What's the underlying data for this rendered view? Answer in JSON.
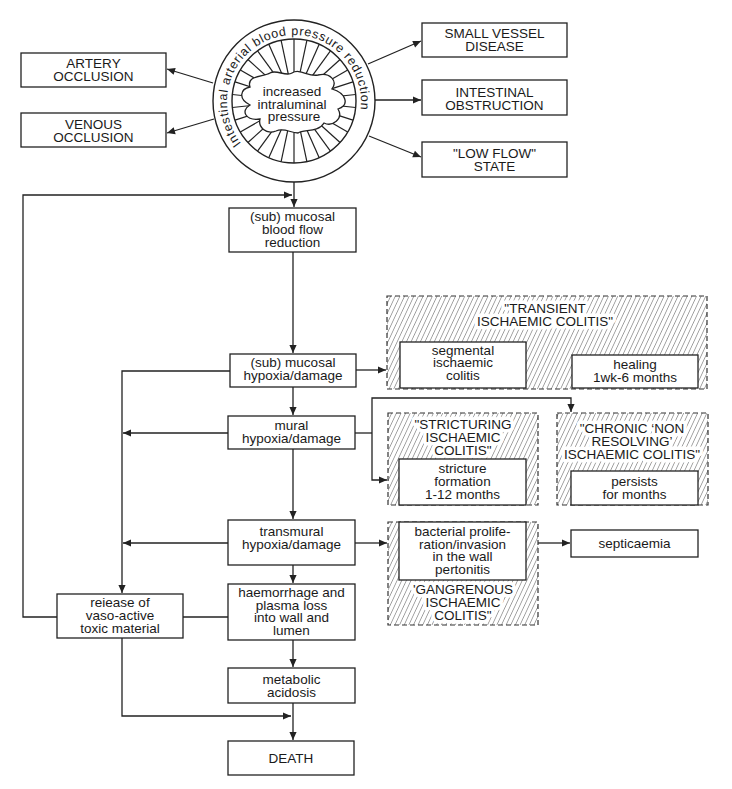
{
  "circle": {
    "ring_label": "Intestinal arterial blood pressure reduction",
    "center_lines": [
      "increased",
      "intraluminal",
      "pressure"
    ]
  },
  "causes": {
    "artery_occlusion": [
      "ARTERY",
      "OCCLUSION"
    ],
    "venous_occlusion": [
      "VENOUS",
      "OCCLUSION"
    ],
    "small_vessel_disease": [
      "SMALL VESSEL",
      "DISEASE"
    ],
    "intestinal_obstruction": [
      "INTESTINAL",
      "OBSTRUCTION"
    ],
    "low_flow_state": [
      "\"LOW FLOW\"",
      "STATE"
    ]
  },
  "cascade": {
    "blood_flow_reduction": [
      "(sub) mucosal",
      "blood flow",
      "reduction"
    ],
    "mucosal_hypoxia": [
      "(sub) mucosal",
      "hypoxia/damage"
    ],
    "mural_hypoxia": [
      "mural",
      "hypoxia/damage"
    ],
    "transmural_hypoxia": [
      "transmural",
      "hypoxia/damage"
    ],
    "haemorrhage": [
      "haemorrhage and",
      "plasma loss",
      "into wall and",
      "lumen"
    ],
    "metabolic_acidosis": [
      "metabolic",
      "acidosis"
    ],
    "death": [
      "DEATH"
    ],
    "toxic_release": [
      "reiease of",
      "vaso-active",
      "toxic material"
    ]
  },
  "outcomes": {
    "transient": {
      "label": [
        "\"TRANSIENT",
        "ISCHAEMIC COLITIS\""
      ],
      "segmental": [
        "segmental",
        "ischaemic",
        "colitis"
      ],
      "healing": [
        "healing",
        "1wk-6 months"
      ]
    },
    "stricturing": {
      "label": [
        "\"STRICTURING",
        "ISCHAEMIC",
        "COLITIS\""
      ],
      "stricture": [
        "stricture",
        "formation",
        "1-12 months"
      ]
    },
    "chronic": {
      "label": [
        "\"CHRONIC ‘NON",
        "RESOLVING’",
        "ISCHAEMIC COLITIS\""
      ],
      "persists": [
        "persists",
        "for months"
      ]
    },
    "gangrenous": {
      "label": [
        "'GANGRENOUS",
        "ISCHAEMIC",
        "COLITIS\""
      ],
      "bacterial": [
        "bacterial prolife-",
        "ration/invasion",
        "in the wall",
        "pertonitis"
      ]
    },
    "septicaemia": [
      "septicaemia"
    ]
  },
  "edges": [
    {
      "from": "circle",
      "to": "artery_occlusion"
    },
    {
      "from": "circle",
      "to": "venous_occlusion"
    },
    {
      "from": "circle",
      "to": "small_vessel_disease"
    },
    {
      "from": "circle",
      "to": "intestinal_obstruction"
    },
    {
      "from": "circle",
      "to": "low_flow_state"
    },
    {
      "from": "circle",
      "to": "blood_flow_reduction"
    },
    {
      "from": "toxic_release",
      "to": "blood_flow_reduction"
    },
    {
      "from": "blood_flow_reduction",
      "to": "mucosal_hypoxia"
    },
    {
      "from": "mucosal_hypoxia",
      "to": "mural_hypoxia"
    },
    {
      "from": "mucosal_hypoxia",
      "to": "toxic_release"
    },
    {
      "from": "mucosal_hypoxia",
      "to": "transient"
    },
    {
      "from": "segmental",
      "to": "healing"
    },
    {
      "from": "mural_hypoxia",
      "to": "transmural_hypoxia"
    },
    {
      "from": "mural_hypoxia",
      "to": "toxic_release"
    },
    {
      "from": "mural_hypoxia",
      "to": "stricturing"
    },
    {
      "from": "mural_hypoxia",
      "to": "chronic"
    },
    {
      "from": "transmural_hypoxia",
      "to": "toxic_release"
    },
    {
      "from": "transmural_hypoxia",
      "to": "gangrenous"
    },
    {
      "from": "gangrenous",
      "to": "septicaemia"
    },
    {
      "from": "transmural_hypoxia",
      "to": "haemorrhage"
    },
    {
      "from": "haemorrhage",
      "to": "toxic_release"
    },
    {
      "from": "haemorrhage",
      "to": "metabolic_acidosis"
    },
    {
      "from": "metabolic_acidosis",
      "to": "death"
    },
    {
      "from": "toxic_release",
      "to": "death"
    }
  ]
}
